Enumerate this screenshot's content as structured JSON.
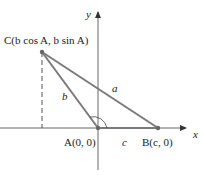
{
  "diagram": {
    "axes": {
      "x_label": "x",
      "y_label": "y"
    },
    "points": {
      "C": {
        "label": "C(b cos A, b sin A)"
      },
      "A": {
        "label": "A(0, 0)"
      },
      "B": {
        "label": "B(c, 0)"
      }
    },
    "sides": {
      "a": "a",
      "b": "b",
      "c": "c"
    },
    "colors": {
      "triangle": "#7a7a7a",
      "axes": "#666666",
      "text": "#222222"
    }
  }
}
